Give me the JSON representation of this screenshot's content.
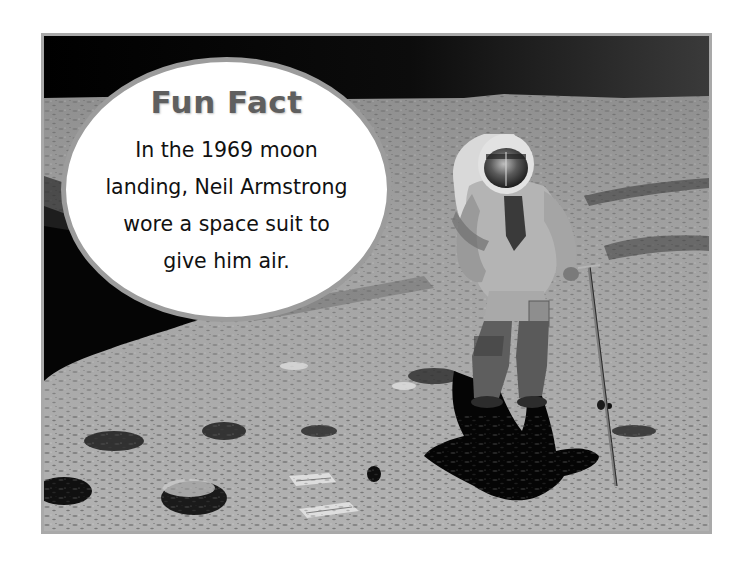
{
  "fun_fact": {
    "title": "Fun Fact",
    "lines": [
      "In the 1969 moon",
      "landing, Neil Armstrong",
      "wore a space suit to",
      "give him air."
    ]
  },
  "photo": {
    "subject": "astronaut on lunar surface holding sampling pole",
    "frame_color": "#a9a9a9",
    "sky_color": "#000000"
  },
  "bubble": {
    "fill": "#ffffff",
    "outline_color": "#9c9c9c",
    "title_color": "#5f5f5f",
    "text_color": "#111111"
  }
}
